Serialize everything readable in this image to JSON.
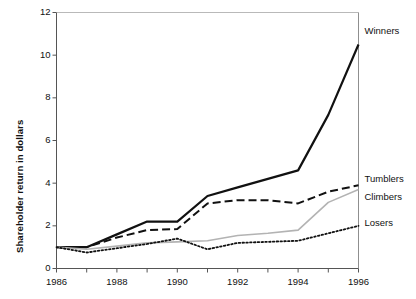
{
  "chart_data": {
    "type": "line",
    "title": "",
    "xlabel": "",
    "ylabel": "Shareholder return in dollars",
    "xlim": [
      1986,
      1996
    ],
    "ylim": [
      0,
      12
    ],
    "grid": false,
    "legend_position": "right-inline",
    "x": [
      1986,
      1987,
      1988,
      1989,
      1990,
      1991,
      1992,
      1993,
      1994,
      1995,
      1996
    ],
    "xticks": [
      1986,
      1987,
      1988,
      1989,
      1990,
      1991,
      1992,
      1993,
      1994,
      1995,
      1996
    ],
    "xtick_labels": [
      "1986",
      "",
      "1988",
      "",
      "1990",
      "",
      "1992",
      "",
      "1994",
      "",
      "1996"
    ],
    "yticks": [
      0,
      2,
      4,
      6,
      8,
      10,
      12
    ],
    "ytick_labels": [
      "0",
      "2",
      "4",
      "6",
      "8",
      "10",
      "12"
    ],
    "series": [
      {
        "name": "Winners",
        "style": "solid",
        "color": "#111111",
        "width": 2.2,
        "values": [
          1.0,
          1.0,
          1.6,
          2.2,
          2.2,
          3.4,
          3.8,
          4.2,
          4.6,
          7.2,
          10.5
        ]
      },
      {
        "name": "Tumblers",
        "style": "dashed",
        "color": "#111111",
        "width": 2.0,
        "values": [
          1.0,
          1.0,
          1.45,
          1.8,
          1.85,
          3.05,
          3.2,
          3.2,
          3.05,
          3.6,
          3.9
        ]
      },
      {
        "name": "Climbers",
        "style": "solid",
        "color": "#b3b3b3",
        "width": 1.6,
        "values": [
          1.0,
          0.9,
          1.05,
          1.2,
          1.25,
          1.3,
          1.55,
          1.65,
          1.8,
          3.1,
          3.7
        ]
      },
      {
        "name": "Losers",
        "style": "dotted",
        "color": "#111111",
        "width": 1.8,
        "values": [
          1.0,
          0.75,
          0.95,
          1.15,
          1.4,
          0.9,
          1.2,
          1.25,
          1.3,
          1.65,
          2.0
        ]
      }
    ],
    "annotations": [
      {
        "text": "Winners",
        "series": "Winners",
        "at_x": 1996
      },
      {
        "text": "Tumblers",
        "series": "Tumblers",
        "at_x": 1996
      },
      {
        "text": "Climbers",
        "series": "Climbers",
        "at_x": 1996
      },
      {
        "text": "Losers",
        "series": "Losers",
        "at_x": 1996
      }
    ]
  },
  "axes": {
    "y_title": "Shareholder return in dollars"
  }
}
